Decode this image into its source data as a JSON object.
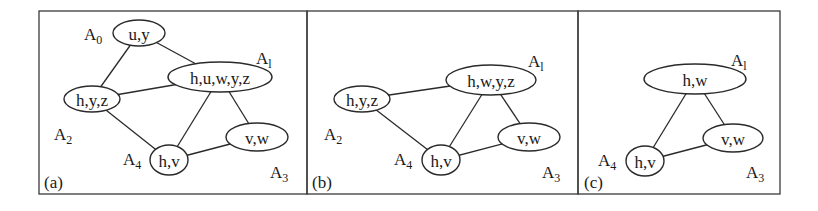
{
  "figure": {
    "panels": [
      {
        "id": "a",
        "label": "(a)",
        "box": {
          "x": 39,
          "y": 11,
          "w": 268,
          "h": 183
        },
        "label_pos": {
          "x": 44,
          "y": 188
        },
        "nodes": [
          {
            "id": "A0",
            "name": "A",
            "sub": "0",
            "vars": "u,y",
            "cx": 139,
            "cy": 33,
            "rx": 26,
            "ry": 13,
            "ax": 84,
            "ay": 40
          },
          {
            "id": "A1",
            "name": "A",
            "sub": "l",
            "vars": "h,u,w,y,z",
            "cx": 220,
            "cy": 77,
            "rx": 52,
            "ry": 15,
            "ax": 256,
            "ay": 64
          },
          {
            "id": "A2",
            "name": "A",
            "sub": "2",
            "vars": "h,y,z",
            "cx": 92,
            "cy": 99,
            "rx": 28,
            "ry": 13,
            "ax": 54,
            "ay": 140
          },
          {
            "id": "A3",
            "name": "A",
            "sub": "3",
            "vars": "v,w",
            "cx": 257,
            "cy": 137,
            "rx": 31,
            "ry": 14,
            "ax": 270,
            "ay": 178
          },
          {
            "id": "A4",
            "name": "A",
            "sub": "4",
            "vars": "h,v",
            "cx": 169,
            "cy": 160,
            "rx": 19,
            "ry": 15,
            "ax": 123,
            "ay": 165
          }
        ],
        "edges": [
          [
            "A0",
            "A2"
          ],
          [
            "A0",
            "A1"
          ],
          [
            "A2",
            "A1"
          ],
          [
            "A2",
            "A4"
          ],
          [
            "A1",
            "A4"
          ],
          [
            "A1",
            "A3"
          ],
          [
            "A4",
            "A3"
          ]
        ]
      },
      {
        "id": "b",
        "label": "(b)",
        "box": {
          "x": 307,
          "y": 11,
          "w": 271,
          "h": 183
        },
        "label_pos": {
          "x": 312,
          "y": 188
        },
        "nodes": [
          {
            "id": "A1",
            "name": "A",
            "sub": "l",
            "vars": "h,w,y,z",
            "cx": 491,
            "cy": 80,
            "rx": 45,
            "ry": 15,
            "ax": 528,
            "ay": 67
          },
          {
            "id": "A2",
            "name": "A",
            "sub": "2",
            "vars": "h,y,z",
            "cx": 362,
            "cy": 99,
            "rx": 28,
            "ry": 13,
            "ax": 324,
            "ay": 140
          },
          {
            "id": "A3",
            "name": "A",
            "sub": "3",
            "vars": "v,w",
            "cx": 529,
            "cy": 137,
            "rx": 31,
            "ry": 14,
            "ax": 542,
            "ay": 178
          },
          {
            "id": "A4",
            "name": "A",
            "sub": "4",
            "vars": "h,v",
            "cx": 441,
            "cy": 160,
            "rx": 19,
            "ry": 15,
            "ax": 394,
            "ay": 165
          }
        ],
        "edges": [
          [
            "A2",
            "A1"
          ],
          [
            "A2",
            "A4"
          ],
          [
            "A1",
            "A4"
          ],
          [
            "A1",
            "A3"
          ],
          [
            "A4",
            "A3"
          ]
        ]
      },
      {
        "id": "c",
        "label": "(c)",
        "box": {
          "x": 578,
          "y": 11,
          "w": 202,
          "h": 183
        },
        "label_pos": {
          "x": 584,
          "y": 188
        },
        "nodes": [
          {
            "id": "A1",
            "name": "A",
            "sub": "l",
            "vars": "h,w",
            "cx": 695,
            "cy": 79,
            "rx": 51,
            "ry": 15,
            "ax": 731,
            "ay": 66
          },
          {
            "id": "A3",
            "name": "A",
            "sub": "3",
            "vars": "v,w",
            "cx": 733,
            "cy": 138,
            "rx": 30,
            "ry": 14,
            "ax": 746,
            "ay": 178
          },
          {
            "id": "A4",
            "name": "A",
            "sub": "4",
            "vars": "h,v",
            "cx": 645,
            "cy": 161,
            "rx": 19,
            "ry": 15,
            "ax": 598,
            "ay": 166
          }
        ],
        "edges": [
          [
            "A1",
            "A4"
          ],
          [
            "A1",
            "A3"
          ],
          [
            "A4",
            "A3"
          ]
        ]
      }
    ]
  }
}
